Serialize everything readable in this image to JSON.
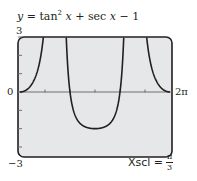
{
  "chart_data": {
    "type": "line",
    "title_parts": {
      "lhs": "y",
      "eq": " = tan",
      "sup": "2",
      "x1": "x",
      "mid": " + sec ",
      "x2": "x",
      "tail": " − 1"
    },
    "function": "tan(x)^2 + sec(x) - 1",
    "xlabel": "",
    "ylabel": "",
    "xlim": [
      0,
      6.2832
    ],
    "ylim": [
      -3,
      3
    ],
    "x_tick_labels": {
      "left": "0",
      "right": "2π"
    },
    "y_tick_labels": {
      "top": "3",
      "bottom": "−3"
    },
    "x_ticks_step": "π/3",
    "y_ticks_step": 1,
    "grid": false,
    "annotation": {
      "label": "Xscl =",
      "num": "π",
      "den": "3"
    },
    "series": [
      {
        "name": "y = tan² x + sec x − 1",
        "x_min_point": [
          3.1416,
          -2
        ],
        "zeros": [
          0,
          2.0944,
          4.1888,
          6.2832
        ],
        "asymptotes": [
          1.5708,
          4.7124
        ]
      }
    ],
    "colors": {
      "frame": "#231f20",
      "plot_bg": "#e6e7e8",
      "curve": "#231f20"
    }
  }
}
